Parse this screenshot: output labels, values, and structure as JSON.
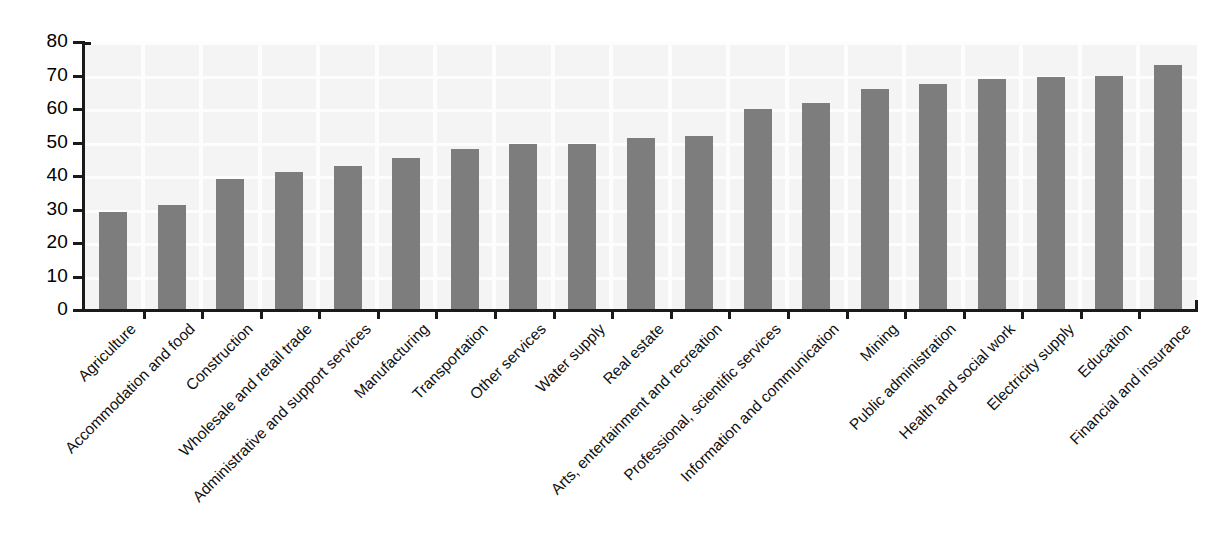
{
  "chart_data": {
    "type": "bar",
    "title": "",
    "subtitle": "",
    "xlabel": "",
    "ylabel": "",
    "ylim": [
      0,
      80
    ],
    "ytick_values": [
      0,
      10,
      20,
      30,
      40,
      50,
      60,
      70,
      80
    ],
    "ytick_labels": [
      "0",
      "10",
      "20",
      "30",
      "40",
      "50",
      "60",
      "70",
      "80"
    ],
    "grid": true,
    "legend": "none",
    "orientation": "vertical",
    "sorted": "ascending",
    "bar_color": "#7d7d7d",
    "plot_background": "#f4f4f4",
    "axis_color": "#1a1a1a",
    "categories": [
      "Agriculture",
      "Accommodation and food",
      "Construction",
      "Wholesale and retail trade",
      "Administrative and support services",
      "Manufacturing",
      "Transportation",
      "Other services",
      "Water supply",
      "Real estate",
      "Arts, entertainment and recreation",
      "Professional, scientific services",
      "Information and communication",
      "Mining",
      "Public administration",
      "Health and social work",
      "Electricity supply",
      "Education",
      "Financial and insurance"
    ],
    "values": [
      29.3,
      31.3,
      39.1,
      41.3,
      43.0,
      45.4,
      48.1,
      49.5,
      49.6,
      51.4,
      51.9,
      60.0,
      61.8,
      66.0,
      67.4,
      68.9,
      69.5,
      70.0,
      73.0
    ]
  }
}
